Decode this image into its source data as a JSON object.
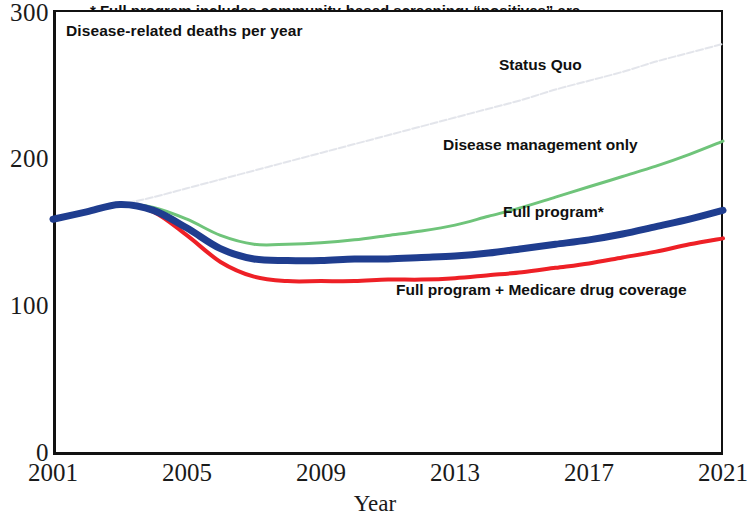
{
  "chart_data": {
    "type": "line",
    "title": "Disease-related deaths per year",
    "xlabel": "Year",
    "ylabel": "",
    "xlim": [
      2001,
      2021
    ],
    "ylim": [
      0,
      300
    ],
    "grid": false,
    "legend_position": "inline-annotations",
    "xticks": [
      "2001",
      "2005",
      "2009",
      "2013",
      "2017",
      "2021"
    ],
    "xtick_values": [
      2001,
      2005,
      2009,
      2013,
      2017,
      2021
    ],
    "yticks": [
      "0",
      "100",
      "200",
      "300"
    ],
    "ytick_values": [
      0,
      100,
      200,
      300
    ],
    "x": [
      2001,
      2002,
      2003,
      2004,
      2005,
      2006,
      2007,
      2008,
      2009,
      2010,
      2011,
      2012,
      2013,
      2014,
      2015,
      2016,
      2017,
      2018,
      2019,
      2020,
      2021
    ],
    "series": [
      {
        "name": "Status Quo",
        "color": "#e2e4ea",
        "style": "faint-dotted",
        "width": 2,
        "label": "Status Quo",
        "values": [
          158,
          163,
          168,
          173,
          179,
          185,
          191,
          197,
          203,
          209,
          215,
          221,
          227,
          233,
          239,
          246,
          252,
          258,
          265,
          271,
          277
        ]
      },
      {
        "name": "Disease management only",
        "color": "#6fc47a",
        "style": "solid",
        "width": 3,
        "label": "Disease management only",
        "values": [
          158,
          163,
          168,
          166,
          158,
          147,
          141,
          141,
          142,
          144,
          147,
          150,
          154,
          160,
          166,
          173,
          180,
          187,
          194,
          202,
          211
        ]
      },
      {
        "name": "Full program*",
        "color": "#1f3d8f",
        "style": "solid",
        "width": 7,
        "label": "Full program*",
        "values": [
          158,
          163,
          168,
          164,
          152,
          138,
          131,
          130,
          130,
          131,
          131,
          132,
          133,
          135,
          138,
          141,
          144,
          148,
          153,
          158,
          164
        ]
      },
      {
        "name": "Full program + Medicare drug coverage",
        "color": "#ee2026",
        "style": "solid",
        "width": 4,
        "label": "Full program + Medicare drug coverage",
        "values": [
          158,
          163,
          168,
          163,
          147,
          129,
          119,
          116,
          116,
          116,
          117,
          117,
          118,
          120,
          122,
          125,
          128,
          132,
          136,
          141,
          145
        ]
      }
    ],
    "annotations": [
      "* Full program includes community-based screening; “positives” are",
      "referred to physician for follow-up testing and counseling."
    ]
  },
  "axis": {
    "y_labels": {
      "t300": "300",
      "t200": "200",
      "t100": "100",
      "t0": "0"
    },
    "x_labels": [
      "2001",
      "2005",
      "2009",
      "2013",
      "2017",
      "2021"
    ],
    "x_title": "Year"
  },
  "labels": {
    "plot_title": "Disease-related deaths per year",
    "status_quo": "Status Quo",
    "disease_management": "Disease management only",
    "full_program": "Full program*",
    "full_program_medicare": "Full program + Medicare drug coverage",
    "footnote_line1": "* Full program includes community-based screening; “positives” are",
    "footnote_line2": "referred to physician for follow-up testing and counseling."
  },
  "colors": {
    "status_quo": "#e2e4ea",
    "disease_management": "#6fc47a",
    "full_program": "#1f3d8f",
    "full_program_medicare": "#ee2026",
    "axis": "#111111",
    "text": "#1a1a1a"
  }
}
